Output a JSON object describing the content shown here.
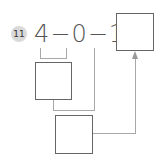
{
  "problem": {
    "number": "11",
    "expression": "4−0−1=",
    "tokens": [
      "4",
      "−",
      "0",
      "−",
      "1",
      "="
    ]
  },
  "boxes": {
    "answer": "",
    "intermediate": "",
    "final_step": ""
  },
  "colors": {
    "badge_bg": "#d9d9d9",
    "text": "#555555",
    "box_border": "#666666",
    "connector": "#a8a8a8"
  }
}
